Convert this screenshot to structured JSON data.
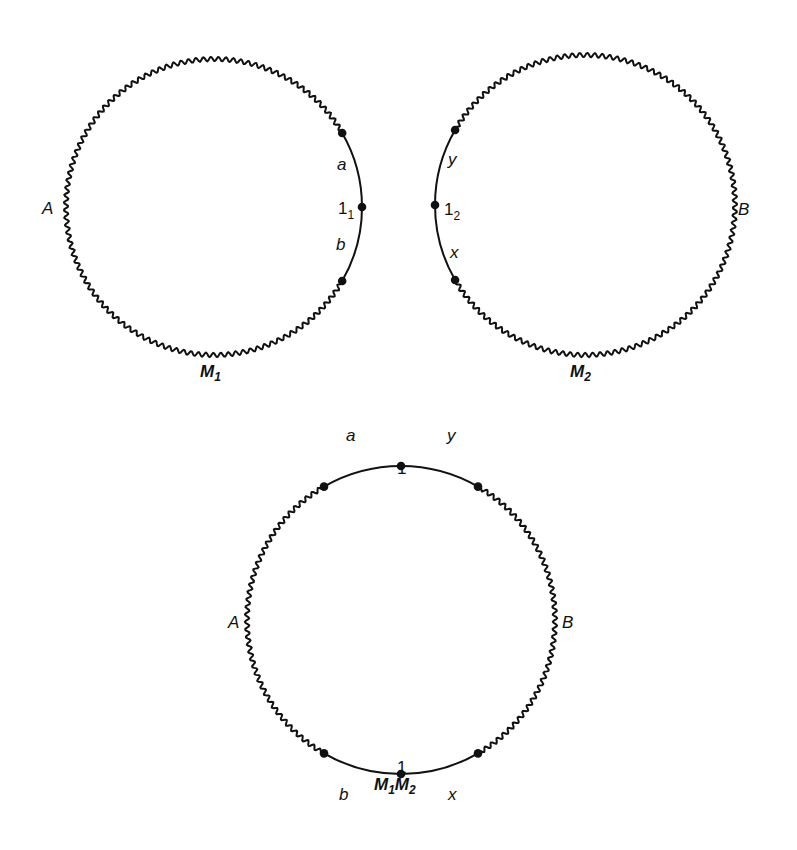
{
  "figure": {
    "ink_color": "#111111",
    "background": "#ffffff"
  },
  "circles": [
    {
      "id": "M1",
      "cx": 214,
      "cy": 207,
      "r": 148,
      "title": "M",
      "title_sub": "1",
      "title_pos": [
        200,
        377
      ],
      "smooth_arc_deg": [
        -30,
        30
      ],
      "dots_deg": [
        -30,
        0,
        30
      ],
      "labels": [
        {
          "text": "A",
          "x": 42,
          "y": 214,
          "italic": true,
          "bold": false
        },
        {
          "text": "a",
          "x": 337,
          "y": 170,
          "italic": true,
          "bold": false
        },
        {
          "text": "1",
          "sub": "1",
          "x": 338,
          "y": 214,
          "italic": false,
          "bold": false
        },
        {
          "text": "b",
          "x": 336,
          "y": 250,
          "italic": true,
          "bold": false
        }
      ]
    },
    {
      "id": "M2",
      "cx": 585,
      "cy": 205,
      "r": 150,
      "title": "M",
      "title_sub": "2",
      "title_pos": [
        570,
        377
      ],
      "smooth_arc_deg": [
        150,
        210
      ],
      "dots_deg": [
        150,
        180,
        210
      ],
      "labels": [
        {
          "text": "B",
          "x": 738,
          "y": 215,
          "italic": true,
          "bold": false
        },
        {
          "text": "y",
          "x": 448,
          "y": 165,
          "italic": true,
          "bold": false
        },
        {
          "text": "1",
          "sub": "2",
          "x": 444,
          "y": 215,
          "italic": false,
          "bold": false
        },
        {
          "text": "x",
          "x": 450,
          "y": 258,
          "italic": true,
          "bold": false
        }
      ]
    },
    {
      "id": "M1M2",
      "cx": 401,
      "cy": 620,
      "r": 154,
      "title": "M",
      "title_sub": "1",
      "title2": "M",
      "title2_sub": "2",
      "title_pos": [
        374,
        790
      ],
      "smooth_arc_deg_top": [
        240,
        300
      ],
      "smooth_arc_deg_bottom": [
        60,
        120
      ],
      "dots_deg": [
        240,
        270,
        300,
        60,
        90,
        120
      ],
      "labels": [
        {
          "text": "a",
          "x": 346,
          "y": 441,
          "italic": true,
          "bold": false
        },
        {
          "text": "y",
          "x": 447,
          "y": 441,
          "italic": true,
          "bold": false
        },
        {
          "text": "1",
          "x": 397,
          "y": 474,
          "italic": false,
          "bold": false
        },
        {
          "text": "A",
          "x": 228,
          "y": 628,
          "italic": true,
          "bold": false
        },
        {
          "text": "B",
          "x": 562,
          "y": 628,
          "italic": true,
          "bold": false
        },
        {
          "text": "1",
          "x": 397,
          "y": 773,
          "italic": false,
          "bold": false
        },
        {
          "text": "b",
          "x": 339,
          "y": 800,
          "italic": true,
          "bold": false
        },
        {
          "text": "x",
          "x": 448,
          "y": 800,
          "italic": true,
          "bold": false
        }
      ]
    }
  ],
  "wave": {
    "amplitude": 2.2,
    "wavelength": 7.5
  }
}
